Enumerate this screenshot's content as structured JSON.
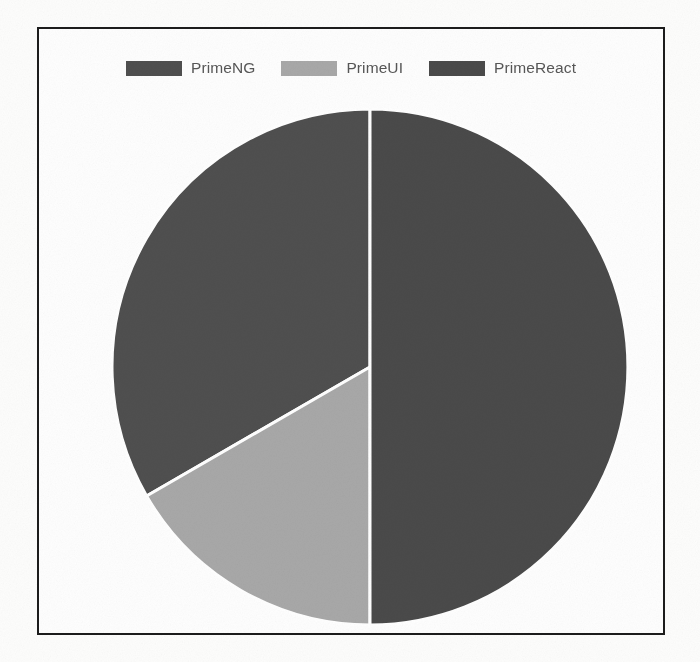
{
  "chart_data": {
    "type": "pie",
    "title": "",
    "categories": [
      "PrimeNG",
      "PrimeUI",
      "PrimeReact"
    ],
    "values": [
      33.3,
      16.7,
      50.0
    ],
    "units": "percent",
    "legend_position": "top",
    "start_angle_deg": 0,
    "direction": "clockwise",
    "grid": false,
    "slices": [
      {
        "label": "PrimeNG",
        "value": 33.3,
        "color": "#4f4f4f",
        "start_angle_deg": 240,
        "end_angle_deg": 360,
        "sweep_deg": 120
      },
      {
        "label": "PrimeUI",
        "value": 16.7,
        "color": "#a8a8a8",
        "start_angle_deg": 180,
        "end_angle_deg": 240,
        "sweep_deg": 60
      },
      {
        "label": "PrimeReact",
        "value": 50.0,
        "color": "#4a4a4a",
        "start_angle_deg": 0,
        "end_angle_deg": 180,
        "sweep_deg": 180
      }
    ]
  },
  "legend": {
    "items": [
      {
        "label": "PrimeNG",
        "color": "#4f4f4f",
        "swatch_name": "legend-swatch-primeng"
      },
      {
        "label": "PrimeUI",
        "color": "#a8a8a8",
        "swatch_name": "legend-swatch-primeui"
      },
      {
        "label": "PrimeReact",
        "color": "#4a4a4a",
        "swatch_name": "legend-swatch-primereact"
      }
    ]
  },
  "style": {
    "frame_border_color": "#1c1c1c",
    "background_color": "#fefefe",
    "separator_color": "#ffffff",
    "legend_text_color": "#575757"
  },
  "geometry": {
    "center_x": 368,
    "center_y": 365,
    "radius": 258
  }
}
